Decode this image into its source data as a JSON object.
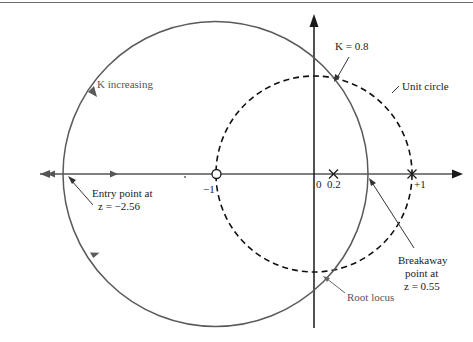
{
  "diagram": {
    "type": "root-locus (z-plane)",
    "labels": {
      "k_increasing_italic": "K",
      "k_increasing_rest": " increasing",
      "k_value_italic": "K",
      "k_value_rest": " = 0.8",
      "unit_circle": "Unit circle",
      "entry_line1": "Entry point at",
      "entry_line2_italic": "z",
      "entry_line2_rest": " = −2.56",
      "breakaway_line1": "Breakaway",
      "breakaway_line2": "point at",
      "breakaway_line3_italic": "z",
      "breakaway_line3_rest": " = 0.55",
      "root_locus": "Root locus"
    },
    "axis_ticks": {
      "minus_one": "−1",
      "zero": "0",
      "pole": "0.2",
      "plus_one": "+1"
    },
    "elements": {
      "zero_at": -1,
      "pole_at": [
        0.2,
        1
      ],
      "entry_point": -2.56,
      "breakaway_point": 0.55,
      "k_at_unit_circle_crossing": 0.8,
      "unit_circle_radius": 1
    },
    "colors": {
      "axes": "#1a1a1a",
      "root_locus": "#5a5a5a",
      "unit_circle": "#111111",
      "text": "#222222"
    }
  }
}
